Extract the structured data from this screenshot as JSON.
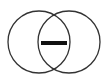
{
  "diagram": {
    "type": "venn-difference-icon",
    "label": "",
    "colors": {
      "background": "#ffffff",
      "stroke": "#333333",
      "bar": "#111111"
    },
    "shapes": {
      "left_circle": {
        "cx": 39,
        "cy": 42,
        "r": 31
      },
      "right_circle": {
        "cx": 69,
        "cy": 42,
        "r": 31
      },
      "minus_bar": {
        "x": 41,
        "y": 41,
        "width": 26,
        "height": 4
      }
    }
  }
}
